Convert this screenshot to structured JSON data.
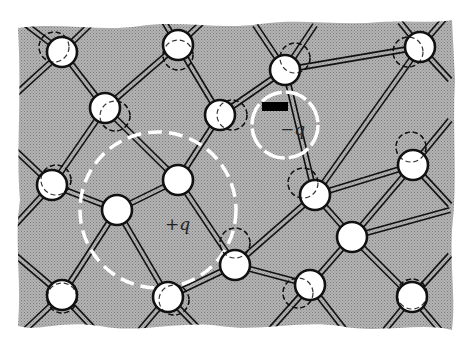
{
  "figure": {
    "background_color": "#ffffff",
    "lattice_fill": "#a8a8a8",
    "bond_color": "#111111",
    "atom_fill": "#ffffff",
    "atom_stroke": "#111111",
    "highlight_color": "#ffffff"
  },
  "labels": {
    "positive_charge": "+q",
    "negative_charge": "−q"
  },
  "atoms": [
    {
      "id": "a1",
      "x": 62,
      "y": 52,
      "displaced": {
        "dx": -8,
        "dy": -5
      }
    },
    {
      "id": "a2",
      "x": 178,
      "y": 45,
      "displaced": {
        "dx": 0,
        "dy": 10
      }
    },
    {
      "id": "a3",
      "x": 420,
      "y": 47,
      "displaced": {
        "dx": -12,
        "dy": 5
      }
    },
    {
      "id": "a4",
      "x": 105,
      "y": 108,
      "displaced": {
        "dx": 10,
        "dy": 8
      }
    },
    {
      "id": "a5",
      "x": 220,
      "y": 115,
      "displaced": {
        "dx": 12,
        "dy": 0
      }
    },
    {
      "id": "a6",
      "x": 285,
      "y": 70,
      "displaced": {
        "dx": 10,
        "dy": -12
      }
    },
    {
      "id": "a7",
      "x": 52,
      "y": 185,
      "displaced": {
        "dx": 4,
        "dy": -5
      }
    },
    {
      "id": "a8",
      "x": 117,
      "y": 210,
      "displaced": null
    },
    {
      "id": "a9",
      "x": 178,
      "y": 180,
      "displaced": null
    },
    {
      "id": "a10",
      "x": 315,
      "y": 195,
      "displaced": {
        "dx": -12,
        "dy": -12
      }
    },
    {
      "id": "a11",
      "x": 413,
      "y": 165,
      "displaced": {
        "dx": -2,
        "dy": -18
      }
    },
    {
      "id": "a12",
      "x": 235,
      "y": 265,
      "displaced": {
        "dx": 0,
        "dy": -22
      }
    },
    {
      "id": "a13",
      "x": 352,
      "y": 237,
      "displaced": null
    },
    {
      "id": "a14",
      "x": 62,
      "y": 295,
      "displaced": {
        "dx": 0,
        "dy": 3
      }
    },
    {
      "id": "a15",
      "x": 168,
      "y": 297,
      "displaced": {
        "dx": 6,
        "dy": 3
      }
    },
    {
      "id": "a16",
      "x": 310,
      "y": 285,
      "displaced": {
        "dx": -12,
        "dy": 8
      }
    },
    {
      "id": "a17",
      "x": 412,
      "y": 297,
      "displaced": {
        "dx": 0,
        "dy": -3
      }
    }
  ],
  "bonds": [
    [
      "a1",
      "a4"
    ],
    [
      "a4",
      "a2"
    ],
    [
      "a4",
      "a7"
    ],
    [
      "a4",
      "a9"
    ],
    [
      "a2",
      "a5"
    ],
    [
      "a5",
      "a6"
    ],
    [
      "a5",
      "a9"
    ],
    [
      "a6",
      "a10"
    ],
    [
      "a6",
      "a3"
    ],
    [
      "a3",
      "a10"
    ],
    [
      "a10",
      "a11"
    ],
    [
      "a10",
      "a12"
    ],
    [
      "a10",
      "a13"
    ],
    [
      "a11",
      "a13"
    ],
    [
      "a13",
      "a16"
    ],
    [
      "a13",
      "a17"
    ],
    [
      "a12",
      "a16"
    ],
    [
      "a12",
      "a15"
    ],
    [
      "a9",
      "a12"
    ],
    [
      "a8",
      "a14"
    ],
    [
      "a8",
      "a15"
    ],
    [
      "a7",
      "a8"
    ],
    [
      "a8",
      "a9"
    ]
  ],
  "edge_bonds": [
    {
      "from": "a1",
      "to_x": 20,
      "to_y": 20
    },
    {
      "from": "a1",
      "to_x": 100,
      "to_y": 15
    },
    {
      "from": "a1",
      "to_x": 15,
      "to_y": 95
    },
    {
      "from": "a2",
      "to_x": 160,
      "to_y": 15
    },
    {
      "from": "a2",
      "to_x": 210,
      "to_y": 15
    },
    {
      "from": "a6",
      "to_x": 255,
      "to_y": 25
    },
    {
      "from": "a6",
      "to_x": 315,
      "to_y": 25
    },
    {
      "from": "a3",
      "to_x": 400,
      "to_y": 22
    },
    {
      "from": "a3",
      "to_x": 445,
      "to_y": 18
    },
    {
      "from": "a3",
      "to_x": 450,
      "to_y": 80
    },
    {
      "from": "a7",
      "to_x": 15,
      "to_y": 150
    },
    {
      "from": "a7",
      "to_x": 15,
      "to_y": 225
    },
    {
      "from": "a11",
      "to_x": 450,
      "to_y": 120
    },
    {
      "from": "a11",
      "to_x": 450,
      "to_y": 205
    },
    {
      "from": "a13",
      "to_x": 450,
      "to_y": 210
    },
    {
      "from": "a14",
      "to_x": 15,
      "to_y": 255
    },
    {
      "from": "a14",
      "to_x": 25,
      "to_y": 330
    },
    {
      "from": "a14",
      "to_x": 95,
      "to_y": 330
    },
    {
      "from": "a15",
      "to_x": 140,
      "to_y": 330
    },
    {
      "from": "a15",
      "to_x": 200,
      "to_y": 330
    },
    {
      "from": "a16",
      "to_x": 270,
      "to_y": 330
    },
    {
      "from": "a16",
      "to_x": 345,
      "to_y": 330
    },
    {
      "from": "a17",
      "to_x": 385,
      "to_y": 330
    },
    {
      "from": "a17",
      "to_x": 440,
      "to_y": 330
    },
    {
      "from": "a17",
      "to_x": 450,
      "to_y": 255
    }
  ],
  "highlights": {
    "hole_circle": {
      "cx": 158,
      "cy": 210,
      "r": 78
    },
    "electron_circle": {
      "cx": 285,
      "cy": 125,
      "r": 33
    },
    "electron_bar": {
      "x": 262,
      "y": 102,
      "w": 26,
      "h": 9
    },
    "plus_label": {
      "x": 165,
      "y": 230
    },
    "minus_label": {
      "x": 280,
      "y": 135
    }
  }
}
